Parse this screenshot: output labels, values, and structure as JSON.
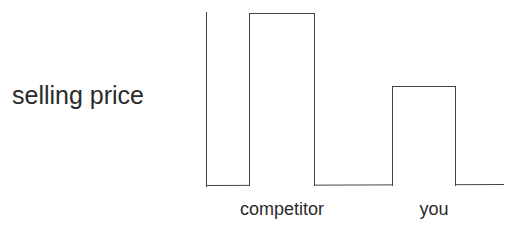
{
  "chart_data": {
    "type": "bar",
    "title": "",
    "xlabel": "",
    "ylabel": "selling price",
    "categories": [
      "competitor",
      "you"
    ],
    "values": [
      1.0,
      0.58
    ],
    "value_units": "relative (no scale shown)",
    "ylim": [
      0,
      1.0
    ],
    "grid": false,
    "legend": null,
    "bar_fill": "#ffffff",
    "bar_stroke": "#444444"
  },
  "labels": {
    "ylabel": "selling price",
    "x0": "competitor",
    "x1": "you"
  }
}
